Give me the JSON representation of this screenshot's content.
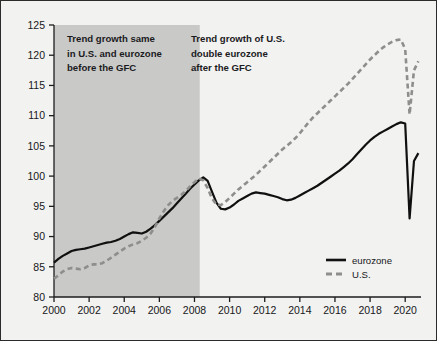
{
  "chart_data": {
    "type": "line",
    "title": "",
    "subtitle": "",
    "xlabel": "",
    "ylabel": "",
    "xlim": [
      2000,
      2020.9
    ],
    "ylim": [
      80,
      125
    ],
    "y_ticks": [
      80,
      85,
      90,
      95,
      100,
      105,
      110,
      115,
      120,
      125
    ],
    "x_ticks": [
      2000,
      2002,
      2004,
      2006,
      2008,
      2010,
      2012,
      2014,
      2016,
      2018,
      2020
    ],
    "grid": false,
    "legend_position": "bottom-right",
    "index_note": "Index, 2008 = 100",
    "shaded_region": {
      "label": "pre-GFC period",
      "x_start": 2000,
      "x_end": 2008.3,
      "color": "#c9c9c7"
    },
    "series": [
      {
        "name": "eurozone",
        "style": "solid",
        "color": "#101010",
        "x": [
          2000.0,
          2000.25,
          2000.5,
          2000.75,
          2001.0,
          2001.25,
          2001.5,
          2001.75,
          2002.0,
          2002.25,
          2002.5,
          2002.75,
          2003.0,
          2003.25,
          2003.5,
          2003.75,
          2004.0,
          2004.25,
          2004.5,
          2004.75,
          2005.0,
          2005.25,
          2005.5,
          2005.75,
          2006.0,
          2006.25,
          2006.5,
          2006.75,
          2007.0,
          2007.25,
          2007.5,
          2007.75,
          2008.0,
          2008.25,
          2008.5,
          2008.75,
          2009.0,
          2009.25,
          2009.5,
          2009.75,
          2010.0,
          2010.25,
          2010.5,
          2010.75,
          2011.0,
          2011.25,
          2011.5,
          2011.75,
          2012.0,
          2012.25,
          2012.5,
          2012.75,
          2013.0,
          2013.25,
          2013.5,
          2013.75,
          2014.0,
          2014.25,
          2014.5,
          2014.75,
          2015.0,
          2015.25,
          2015.5,
          2015.75,
          2016.0,
          2016.25,
          2016.5,
          2016.75,
          2017.0,
          2017.25,
          2017.5,
          2017.75,
          2018.0,
          2018.25,
          2018.5,
          2018.75,
          2019.0,
          2019.25,
          2019.5,
          2019.75,
          2020.0,
          2020.25,
          2020.5,
          2020.75
        ],
        "y": [
          85.7,
          86.3,
          86.8,
          87.2,
          87.6,
          87.8,
          87.9,
          88.0,
          88.2,
          88.4,
          88.6,
          88.8,
          89.0,
          89.1,
          89.3,
          89.6,
          90.0,
          90.4,
          90.7,
          90.6,
          90.5,
          90.8,
          91.3,
          91.9,
          92.6,
          93.3,
          94.0,
          94.7,
          95.5,
          96.3,
          97.1,
          97.9,
          98.6,
          99.3,
          99.8,
          99.2,
          97.4,
          95.6,
          94.6,
          94.5,
          94.8,
          95.3,
          95.9,
          96.3,
          96.7,
          97.1,
          97.3,
          97.2,
          97.1,
          96.9,
          96.7,
          96.5,
          96.2,
          96.0,
          96.1,
          96.4,
          96.8,
          97.2,
          97.6,
          98.0,
          98.4,
          98.9,
          99.4,
          99.9,
          100.4,
          100.9,
          101.5,
          102.1,
          102.8,
          103.6,
          104.4,
          105.2,
          105.9,
          106.5,
          107.0,
          107.4,
          107.8,
          108.2,
          108.6,
          108.9,
          108.7,
          93.0,
          102.5,
          103.8
        ]
      },
      {
        "name": "U.S.",
        "style": "dashed",
        "color": "#8e8e8c",
        "x": [
          2000.0,
          2000.25,
          2000.5,
          2000.75,
          2001.0,
          2001.25,
          2001.5,
          2001.75,
          2002.0,
          2002.25,
          2002.5,
          2002.75,
          2003.0,
          2003.25,
          2003.5,
          2003.75,
          2004.0,
          2004.25,
          2004.5,
          2004.75,
          2005.0,
          2005.25,
          2005.5,
          2005.75,
          2006.0,
          2006.25,
          2006.5,
          2006.75,
          2007.0,
          2007.25,
          2007.5,
          2007.75,
          2008.0,
          2008.25,
          2008.5,
          2008.75,
          2009.0,
          2009.25,
          2009.5,
          2009.75,
          2010.0,
          2010.25,
          2010.5,
          2010.75,
          2011.0,
          2011.25,
          2011.5,
          2011.75,
          2012.0,
          2012.25,
          2012.5,
          2012.75,
          2013.0,
          2013.25,
          2013.5,
          2013.75,
          2014.0,
          2014.25,
          2014.5,
          2014.75,
          2015.0,
          2015.25,
          2015.5,
          2015.75,
          2016.0,
          2016.25,
          2016.5,
          2016.75,
          2017.0,
          2017.25,
          2017.5,
          2017.75,
          2018.0,
          2018.25,
          2018.5,
          2018.75,
          2019.0,
          2019.25,
          2019.5,
          2019.75,
          2020.0,
          2020.25,
          2020.5,
          2020.75
        ],
        "y": [
          83.0,
          83.6,
          84.2,
          84.6,
          84.8,
          84.7,
          84.6,
          84.8,
          85.2,
          85.4,
          85.4,
          85.6,
          86.0,
          86.5,
          87.0,
          87.5,
          88.0,
          88.4,
          88.7,
          88.9,
          89.3,
          89.8,
          90.5,
          91.6,
          93.0,
          94.2,
          95.2,
          95.9,
          96.4,
          96.9,
          97.5,
          98.3,
          99.0,
          99.6,
          99.3,
          98.0,
          96.3,
          95.3,
          95.2,
          95.7,
          96.4,
          97.1,
          97.8,
          98.4,
          99.0,
          99.6,
          100.2,
          100.9,
          101.6,
          102.3,
          103.0,
          103.7,
          104.4,
          105.0,
          105.6,
          106.3,
          107.1,
          108.0,
          108.9,
          109.7,
          110.4,
          111.1,
          111.8,
          112.5,
          113.2,
          113.9,
          114.6,
          115.3,
          116.1,
          116.9,
          117.7,
          118.5,
          119.3,
          120.0,
          120.7,
          121.3,
          121.8,
          122.2,
          122.5,
          122.6,
          121.0,
          110.2,
          117.5,
          119.0
        ]
      }
    ],
    "annotations": [
      {
        "id": "pre-gfc-annotation",
        "lines": [
          "Trend growth same",
          "in U.S. and eurozone",
          "before the GFC"
        ]
      },
      {
        "id": "post-gfc-annotation",
        "lines": [
          "Trend growth of U.S.",
          "double eurozone",
          "after the GFC"
        ]
      }
    ],
    "legend": [
      {
        "label": "eurozone",
        "style": "solid",
        "color": "#101010"
      },
      {
        "label": "U.S.",
        "style": "dashed",
        "color": "#8e8e8c"
      }
    ]
  }
}
